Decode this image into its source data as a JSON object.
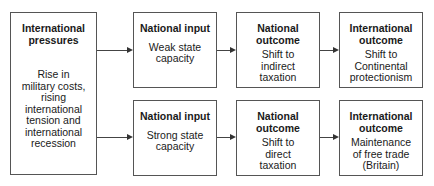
{
  "diagram": {
    "source_box": {
      "title": "International pressures",
      "title_line1": "International",
      "title_line2": "pressures",
      "body_lines": [
        "Rise in",
        "military costs,",
        "rising",
        "international",
        "tension and",
        "international",
        "recession"
      ]
    },
    "rows": [
      {
        "national_input": {
          "title": "National input",
          "body_lines": [
            "Weak state",
            "capacity"
          ]
        },
        "national_outcome": {
          "title_lines": [
            "National",
            "outcome"
          ],
          "body_lines": [
            "Shift to",
            "indirect",
            "taxation"
          ]
        },
        "international_outcome": {
          "title_lines": [
            "International",
            "outcome"
          ],
          "body_lines": [
            "Shift to",
            "Continental",
            "protectionism"
          ]
        }
      },
      {
        "national_input": {
          "title": "National input",
          "body_lines": [
            "Strong state",
            "capacity"
          ]
        },
        "national_outcome": {
          "title_lines": [
            "National",
            "outcome"
          ],
          "body_lines": [
            "Shift to",
            "direct",
            "taxation"
          ]
        },
        "international_outcome": {
          "title_lines": [
            "International",
            "outcome"
          ],
          "body_lines": [
            "Maintenance",
            "of free trade",
            "(Britain)"
          ]
        }
      }
    ],
    "colors": {
      "border": "#555555",
      "arrow": "#333333",
      "text": "#1a1a1a",
      "background": "#ffffff"
    }
  }
}
